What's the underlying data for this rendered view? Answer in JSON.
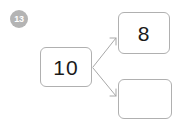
{
  "item": {
    "question_number": "13",
    "whole": {
      "label": "whole-box",
      "value": "10"
    },
    "parts": [
      {
        "label": "part-box-top",
        "value": "8"
      },
      {
        "label": "part-box-bottom",
        "value": ""
      }
    ]
  },
  "connectors": [
    {
      "name": "connector-to-top-part",
      "from": "whole-box",
      "to": "part-box-top"
    },
    {
      "name": "connector-to-bottom-part",
      "from": "whole-box",
      "to": "part-box-bottom"
    }
  ],
  "colors": {
    "background": "#ffffff",
    "box_border": "#b0b0b0",
    "badge_fill": "#b4b4b4",
    "badge_text": "#ffffff",
    "value_text": "#1a1a1a",
    "connector_line": "#a8a8a8"
  }
}
